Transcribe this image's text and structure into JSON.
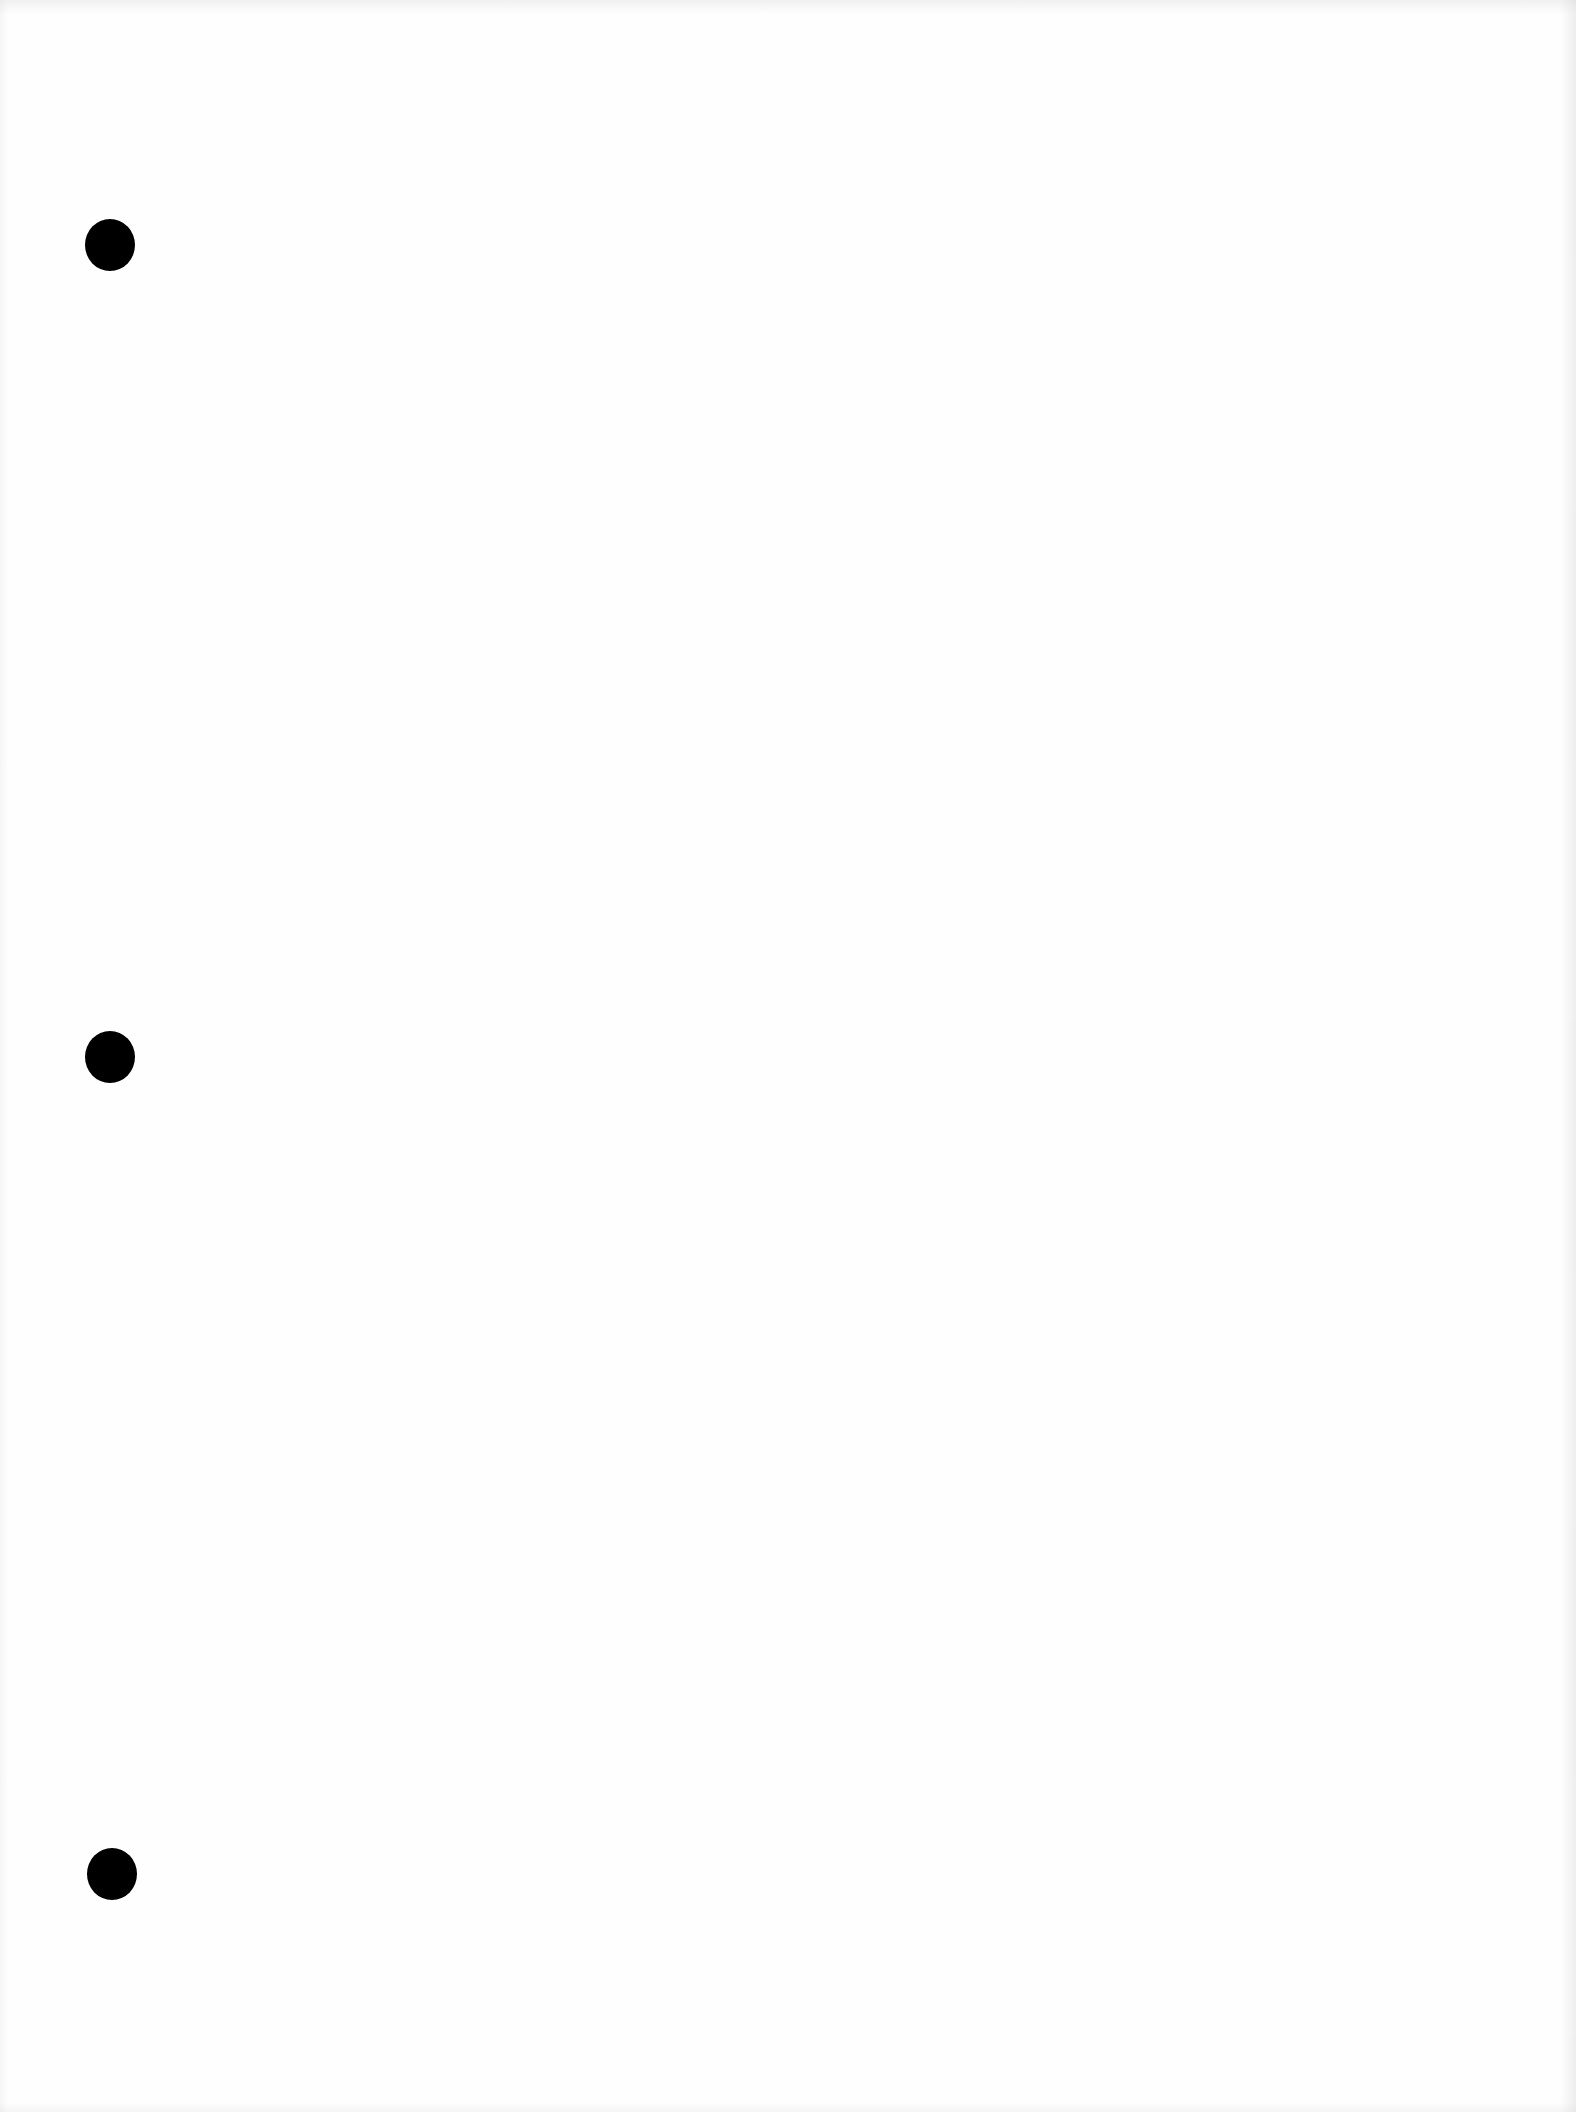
{
  "page": {
    "type": "blank scanned page",
    "background_color": "#fefefe",
    "text": ""
  },
  "punch_holes": [
    {
      "x": 110,
      "y": 245,
      "color": "#000000"
    },
    {
      "x": 110,
      "y": 1057,
      "color": "#000000"
    },
    {
      "x": 112,
      "y": 1874,
      "color": "#000000"
    }
  ]
}
